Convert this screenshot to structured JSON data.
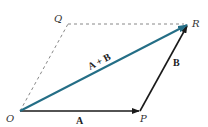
{
  "diagram": {
    "type": "vector-parallelogram",
    "colors": {
      "vector": "#1a1a1a",
      "resultant": "#246e86",
      "dashed": "#888888",
      "label": "#333333"
    },
    "points": {
      "O": {
        "label": "O",
        "x": 20,
        "y": 111
      },
      "P": {
        "label": "P",
        "x": 140,
        "y": 111
      },
      "R": {
        "label": "R",
        "x": 188,
        "y": 24
      },
      "Q": {
        "label": "Q",
        "x": 68,
        "y": 24
      }
    },
    "vectors": {
      "A": {
        "label": "A",
        "from": "O",
        "to": "P"
      },
      "B": {
        "label": "B",
        "from": "P",
        "to": "R"
      },
      "sum": {
        "label": "A + B",
        "from": "O",
        "to": "R"
      }
    },
    "dashed_edges": [
      {
        "from": "O",
        "to": "Q"
      },
      {
        "from": "Q",
        "to": "R"
      }
    ]
  }
}
